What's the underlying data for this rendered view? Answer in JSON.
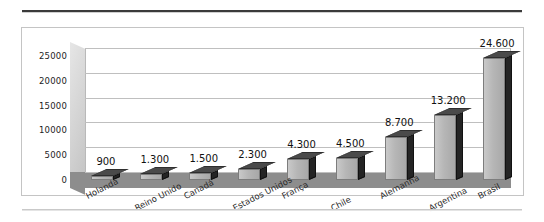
{
  "chart_data": {
    "type": "bar",
    "title": "",
    "xlabel": "",
    "ylabel": "",
    "categories": [
      "Holanda",
      "Reino Unido",
      "Canadá",
      "Estados Unidos",
      "França",
      "Chile",
      "Alemanha",
      "Argentina",
      "Brasil"
    ],
    "values": [
      900,
      1300,
      1500,
      2300,
      4300,
      4500,
      8700,
      13200,
      24600
    ],
    "data_labels": [
      "900",
      "1.300",
      "1.500",
      "2.300",
      "4.300",
      "4.500",
      "8.700",
      "13.200",
      "24.600"
    ],
    "ylim": [
      0,
      25000
    ],
    "ytick_values": [
      0,
      5000,
      10000,
      15000,
      20000,
      25000
    ],
    "ytick_labels": [
      "0",
      "5000",
      "10000",
      "15000",
      "20000",
      "25000"
    ],
    "grid": true,
    "legend": false,
    "style": "3d-column",
    "colors": {
      "bar_front": "#b6b6b6",
      "bar_side": "#242424",
      "bar_top": "#4a4a4a",
      "floor": "#8d8d8d",
      "wall": "#d8d8d8",
      "gridline": "#bfbfbf",
      "border": "#c4c4c4",
      "rule": "#3a3a3a",
      "text": "#1d1d1d"
    }
  }
}
